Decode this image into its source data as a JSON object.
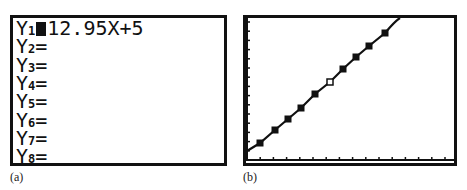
{
  "panel_a": {
    "caption": "(a)",
    "lines": [
      {
        "var": "Y",
        "sub": "1",
        "eq": "=",
        "expr": "12.95X+5",
        "selected": true
      },
      {
        "var": "Y",
        "sub": "2",
        "eq": "=",
        "expr": ""
      },
      {
        "var": "Y",
        "sub": "3",
        "eq": "=",
        "expr": ""
      },
      {
        "var": "Y",
        "sub": "4",
        "eq": "=",
        "expr": ""
      },
      {
        "var": "Y",
        "sub": "5",
        "eq": "=",
        "expr": ""
      },
      {
        "var": "Y",
        "sub": "6",
        "eq": "=",
        "expr": ""
      },
      {
        "var": "Y",
        "sub": "7",
        "eq": "=",
        "expr": ""
      },
      {
        "var": "Y",
        "sub": "8",
        "eq": "=",
        "expr": ""
      }
    ]
  },
  "panel_b": {
    "caption": "(b)",
    "points_px": [
      [
        24,
        143
      ],
      [
        39,
        130
      ],
      [
        52,
        119
      ],
      [
        65,
        108
      ],
      [
        79,
        94
      ],
      [
        94,
        82
      ],
      [
        107,
        69
      ],
      [
        120,
        57
      ],
      [
        133,
        46
      ],
      [
        149,
        33
      ]
    ],
    "open_point_index": 5
  }
}
